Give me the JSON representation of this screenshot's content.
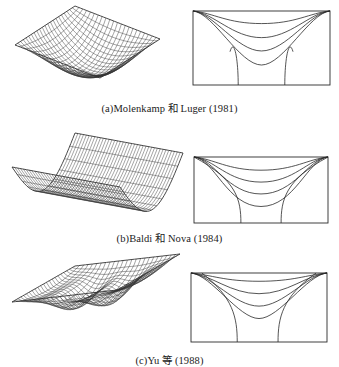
{
  "figure": {
    "panels": [
      {
        "id": "a",
        "caption": "(a)Molenkamp 和 Luger (1981)",
        "caption_top": 100,
        "surface_type": "bowl-square-basin",
        "surface": {
          "origin": [
            15,
            45
          ],
          "u_vec": [
            60,
            -39
          ],
          "v_vec": [
            85,
            33
          ],
          "depth": 30,
          "grid_u": 22,
          "grid_v": 22,
          "shape": "bowl"
        },
        "box": {
          "x": 193,
          "y": 11,
          "w": 137,
          "h": 74
        },
        "contour_curve_depths": [
          0.17,
          0.36,
          0.54,
          0.73
        ],
        "contour_curve_widths": [
          0.5,
          0.42,
          0.36,
          0.32
        ],
        "side_curves": {
          "x_left_bottom": 0.33,
          "x_right_bottom": 0.67,
          "x_top_left": 0.27,
          "x_top_right": 0.73,
          "top_y": 0.55
        }
      },
      {
        "id": "b",
        "caption": "(b)Baldi 和 Nova (1984)",
        "caption_top": 230,
        "surface_type": "trough-cylindrical",
        "surface": {
          "origin": [
            12,
            167
          ],
          "u_vec": [
            63,
            -34
          ],
          "v_vec": [
            108,
            20
          ],
          "depth": 40,
          "grid_u": 12,
          "grid_v": 38,
          "shape": "trough"
        },
        "box": {
          "x": 194,
          "y": 157,
          "w": 134,
          "h": 66
        },
        "contour_curve_depths": [
          0.2,
          0.38,
          0.56,
          0.75
        ],
        "contour_curve_widths": [
          0.5,
          0.5,
          0.5,
          0.5
        ],
        "side_curves": {
          "x_left_bottom": 0.35,
          "x_right_bottom": 0.65,
          "x_top_left": 0.0,
          "x_top_right": 1.0,
          "top_y": 0.0
        }
      },
      {
        "id": "c",
        "caption": "(c)Yu 等 (1988)",
        "caption_top": 352,
        "surface_type": "wavy-basin",
        "surface": {
          "origin": [
            12,
            302
          ],
          "u_vec": [
            63,
            -36
          ],
          "v_vec": [
            105,
            -12
          ],
          "depth": 30,
          "grid_u": 22,
          "grid_v": 24,
          "shape": "wavy"
        },
        "box": {
          "x": 191,
          "y": 273,
          "w": 136,
          "h": 69
        },
        "contour_curve_depths": [
          0.12,
          0.3,
          0.48,
          0.66
        ],
        "contour_curve_widths": [
          0.5,
          0.42,
          0.36,
          0.3
        ],
        "side_curves": {
          "x_left_bottom": 0.34,
          "x_right_bottom": 0.64,
          "x_top_left": 0.08,
          "x_top_right": 0.92,
          "top_y": 0.0
        }
      }
    ],
    "line_color": "#2a2a2a",
    "mesh_color": "#333333"
  }
}
